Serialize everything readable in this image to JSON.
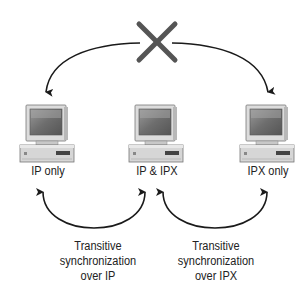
{
  "diagram": {
    "type": "network-synchronization",
    "blocked_symbol": "x-mark",
    "nodes": [
      {
        "id": "left",
        "label": "IP only"
      },
      {
        "id": "middle",
        "label": "IP & IPX"
      },
      {
        "id": "right",
        "label": "IPX only"
      }
    ],
    "links": [
      {
        "from": "left",
        "to": "right",
        "via": "x-mark",
        "blocked": true
      },
      {
        "from": "left",
        "to": "middle",
        "caption": [
          "Transitive",
          "synchronization",
          "over IP"
        ]
      },
      {
        "from": "middle",
        "to": "right",
        "caption": [
          "Transitive",
          "synchronization",
          "over IPX"
        ]
      }
    ],
    "colors": {
      "line": "#1a1a1a",
      "x_mark": "#555555",
      "monitor_body": "#d9d9d9",
      "screen": "#7a7a7a"
    }
  }
}
